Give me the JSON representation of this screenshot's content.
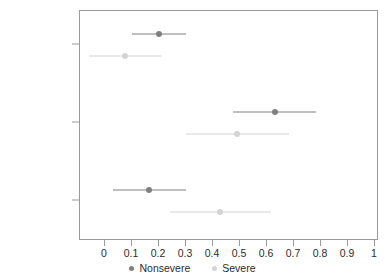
{
  "chart_data": {
    "type": "scatter",
    "title": "",
    "subtitle": "",
    "xlabel": "",
    "ylabel": "",
    "xlim": [
      -0.08,
      1.04
    ],
    "grid": false,
    "legend_position": "bottom",
    "xticks": [
      0,
      0.1,
      0.2,
      0.3,
      0.4,
      0.5,
      0.6,
      0.7,
      0.8,
      0.9,
      1
    ],
    "xticklabels": [
      "0",
      "0.1",
      "0.2",
      "0.3",
      "0.4",
      "0.5",
      "0.6",
      "0.7",
      "0.8",
      "0.9",
      "1"
    ],
    "categories": [
      "Slow-simple",
      "Fast-simple",
      "Fast-complex"
    ],
    "series": [
      {
        "name": "Nonsevere",
        "color": "#808080",
        "values": [
          0.2,
          0.63,
          0.163
        ],
        "ci_low": [
          0.1,
          0.475,
          0.03
        ],
        "ci_high": [
          0.3,
          0.78,
          0.3
        ]
      },
      {
        "name": "Severe",
        "color": "#d4d4d4",
        "values": [
          0.075,
          0.49,
          0.425
        ],
        "ci_low": [
          -0.06,
          0.3,
          0.24
        ],
        "ci_high": [
          0.21,
          0.68,
          0.615
        ]
      }
    ]
  },
  "axis": {
    "frame_color": "#9a9a9a"
  },
  "legend": {
    "items": [
      {
        "label": "Nonsevere",
        "color": "#808080"
      },
      {
        "label": "Severe",
        "color": "#d4d4d4"
      }
    ]
  }
}
